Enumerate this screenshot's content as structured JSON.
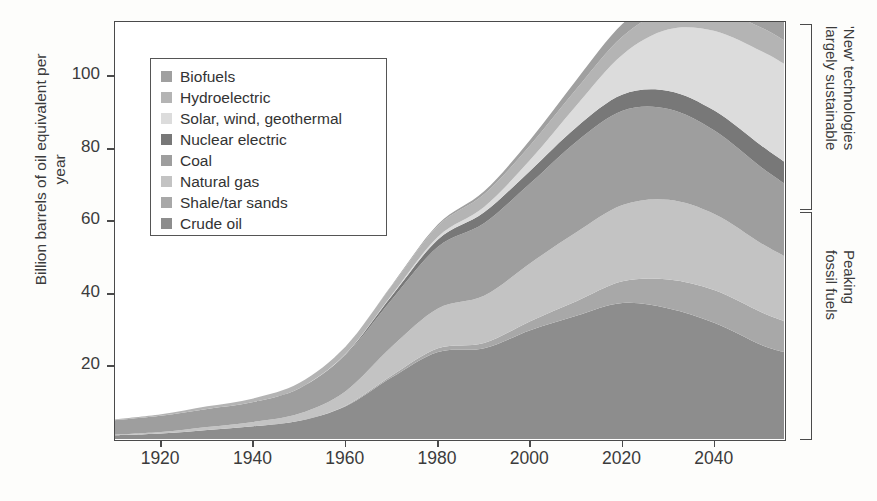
{
  "chart_data": {
    "type": "area",
    "title": "",
    "xlabel": "",
    "ylabel": "Billion barrels of oil equivalent per year",
    "xticks": [
      1920,
      1940,
      1960,
      1980,
      2000,
      2020,
      2040
    ],
    "yticks": [
      20,
      40,
      60,
      80,
      100
    ],
    "xlim": [
      1910,
      2055
    ],
    "ylim": [
      0,
      115
    ],
    "grid": false,
    "legend_position": "inside-top-left",
    "stacking_order_bottom_to_top": [
      "Crude oil",
      "Shale/tar sands",
      "Natural gas",
      "Coal",
      "Nuclear electric",
      "Solar, wind, geothermal",
      "Hydroelectric",
      "Biofuels"
    ],
    "x": [
      1910,
      1920,
      1930,
      1940,
      1950,
      1960,
      1970,
      1980,
      1990,
      2000,
      2010,
      2020,
      2030,
      2040,
      2050,
      2055
    ],
    "series": [
      {
        "name": "Crude oil",
        "color": "#8d8d8d",
        "values": [
          1.0,
          1.5,
          2.5,
          3.5,
          5.0,
          9.0,
          17.0,
          24.0,
          25.0,
          30.0,
          34.0,
          37.5,
          36.0,
          32.0,
          26.0,
          24.0
        ]
      },
      {
        "name": "Shale/tar sands",
        "color": "#a8a8a8",
        "values": [
          0.0,
          0.0,
          0.0,
          0.0,
          0.0,
          0.2,
          0.5,
          1.0,
          1.5,
          2.5,
          4.0,
          6.0,
          8.0,
          9.0,
          9.0,
          8.5
        ]
      },
      {
        "name": "Natural gas",
        "color": "#c3c3c3",
        "values": [
          0.2,
          0.4,
          0.8,
          1.2,
          2.0,
          4.0,
          8.0,
          11.0,
          13.0,
          16.0,
          19.0,
          21.0,
          22.0,
          21.0,
          19.0,
          18.0
        ]
      },
      {
        "name": "Coal",
        "color": "#9e9e9e",
        "values": [
          4.0,
          4.5,
          5.0,
          5.5,
          7.0,
          10.0,
          13.0,
          17.0,
          20.0,
          22.0,
          25.0,
          26.0,
          25.0,
          23.0,
          21.0,
          20.0
        ]
      },
      {
        "name": "Nuclear electric",
        "color": "#787878",
        "values": [
          0.0,
          0.0,
          0.0,
          0.0,
          0.0,
          0.2,
          1.0,
          2.0,
          3.0,
          3.5,
          4.0,
          4.5,
          5.0,
          5.5,
          6.0,
          6.0
        ]
      },
      {
        "name": "Solar, wind, geothermal",
        "color": "#dcdcdc",
        "values": [
          0.0,
          0.0,
          0.0,
          0.0,
          0.0,
          0.1,
          0.3,
          0.8,
          1.5,
          3.0,
          6.0,
          11.0,
          17.0,
          22.0,
          26.0,
          27.0
        ]
      },
      {
        "name": "Hydroelectric",
        "color": "#b4b4b4",
        "values": [
          0.2,
          0.4,
          0.7,
          1.0,
          1.5,
          2.0,
          2.5,
          3.0,
          3.5,
          4.0,
          4.5,
          5.0,
          5.5,
          6.0,
          6.5,
          6.5
        ]
      },
      {
        "name": "Biofuels",
        "color": "#a0a0a0",
        "values": [
          0.0,
          0.0,
          0.0,
          0.0,
          0.0,
          0.0,
          0.2,
          0.4,
          0.8,
          1.5,
          2.5,
          3.5,
          4.5,
          5.5,
          6.0,
          6.0
        ]
      }
    ]
  },
  "legend": {
    "items": [
      {
        "label": "Biofuels",
        "color": "#a0a0a0"
      },
      {
        "label": "Hydroelectric",
        "color": "#b4b4b4"
      },
      {
        "label": "Solar, wind, geothermal",
        "color": "#dcdcdc"
      },
      {
        "label": "Nuclear electric",
        "color": "#787878"
      },
      {
        "label": "Coal",
        "color": "#9e9e9e"
      },
      {
        "label": "Natural gas",
        "color": "#c3c3c3"
      },
      {
        "label": "Shale/tar sands",
        "color": "#a8a8a8"
      },
      {
        "label": "Crude oil",
        "color": "#8d8d8d"
      }
    ]
  },
  "annotations": [
    {
      "id": "new-technologies",
      "text": "'New' technologies\nlargely sustainable"
    },
    {
      "id": "peaking-fossil-fuels",
      "text": "Peaking\nfossil fuels"
    }
  ]
}
